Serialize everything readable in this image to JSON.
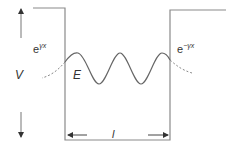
{
  "diagram": {
    "type": "finite potential well",
    "labels": {
      "potential": "V",
      "energy": "E",
      "width": "l",
      "left_decay_base": "e",
      "left_decay_exp": "γx",
      "right_decay_base": "e",
      "right_decay_exp": "−γx"
    },
    "colors": {
      "line": "#8a8a8a",
      "wave": "#666666",
      "text": "#333333"
    }
  }
}
